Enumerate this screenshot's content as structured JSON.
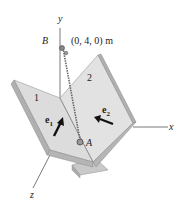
{
  "diagram": {
    "axes": {
      "x": "x",
      "y": "y",
      "z": "z"
    },
    "point_b": "B",
    "point_b_coords": "(0, 4, 0) m",
    "point_a": "A",
    "panel_1_label": "1",
    "panel_2_label": "2",
    "unit_vector_1": {
      "base": "e",
      "sub": "1"
    },
    "unit_vector_2": {
      "base": "e",
      "sub": "2"
    }
  },
  "colors": {
    "panel_fill": "#d9d9d9",
    "panel_edge": "#a9a9a9",
    "line": "#555555",
    "arrow": "#111111"
  }
}
